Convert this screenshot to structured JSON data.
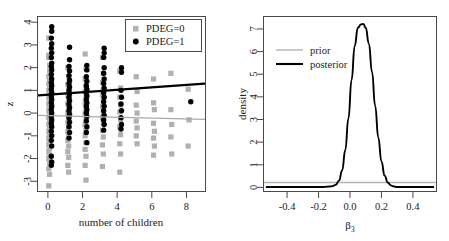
{
  "figure": {
    "title": "",
    "panels": [
      "scatter",
      "density"
    ]
  },
  "left_panel": {
    "xlabel": "number of children",
    "ylabel": "z",
    "xticks": [
      "0",
      "2",
      "4",
      "6",
      "8"
    ],
    "yticks": [
      "-3",
      "-2",
      "-1",
      "0",
      "1",
      "2",
      "3",
      "4"
    ],
    "legend": {
      "items": [
        {
          "label": "PDEG=0",
          "marker": "square",
          "color": "#b0b0b0"
        },
        {
          "label": "PDEG=1",
          "marker": "circle",
          "color": "#000000"
        }
      ]
    }
  },
  "right_panel": {
    "xlabel": "β₃",
    "xlabel_base": "β",
    "xlabel_sub": "3",
    "ylabel": "density",
    "xticks": [
      "-0.4",
      "-0.2",
      "0.0",
      "0.2",
      "0.4"
    ],
    "yticks": [
      "0",
      "1",
      "2",
      "3",
      "4",
      "5",
      "6",
      "7"
    ],
    "legend": {
      "items": [
        {
          "label": "prior",
          "color": "#b4b4b4"
        },
        {
          "label": "posterior",
          "color": "#000000"
        }
      ]
    }
  },
  "chart_data": [
    {
      "type": "scatter",
      "title": "",
      "xlabel": "number of children",
      "ylabel": "z",
      "xlim": [
        -0.6,
        9.1
      ],
      "ylim": [
        -3.45,
        4.25
      ],
      "xticks": [
        0,
        2,
        4,
        6,
        8
      ],
      "yticks": [
        -3,
        -2,
        -1,
        0,
        1,
        2,
        3,
        4
      ],
      "grid": false,
      "legend_position": "top-right",
      "series": [
        {
          "name": "PDEG=0",
          "marker": "square",
          "color": "#b0b0b0",
          "points": [
            [
              0.05,
              3.3
            ],
            [
              0.05,
              2.55
            ],
            [
              0.05,
              2.45
            ],
            [
              0.1,
              2.1
            ],
            [
              0.1,
              1.85
            ],
            [
              0.05,
              1.6
            ],
            [
              0.1,
              1.45
            ],
            [
              0.05,
              1.3
            ],
            [
              0.1,
              1.15
            ],
            [
              0.05,
              1.0
            ],
            [
              0.1,
              0.85
            ],
            [
              0.05,
              0.7
            ],
            [
              0.1,
              0.55
            ],
            [
              0.05,
              0.4
            ],
            [
              0.1,
              0.25
            ],
            [
              0.05,
              0.1
            ],
            [
              0.1,
              -0.05
            ],
            [
              0.05,
              -0.2
            ],
            [
              0.1,
              -0.35
            ],
            [
              0.05,
              -0.5
            ],
            [
              0.1,
              -0.65
            ],
            [
              0.05,
              -0.8
            ],
            [
              0.1,
              -0.95
            ],
            [
              0.05,
              -1.1
            ],
            [
              0.1,
              -1.25
            ],
            [
              0.05,
              -1.4
            ],
            [
              0.1,
              -1.55
            ],
            [
              0.05,
              -1.7
            ],
            [
              0.1,
              -1.85
            ],
            [
              0.05,
              -2.0
            ],
            [
              0.1,
              -2.2
            ],
            [
              0.05,
              -2.45
            ],
            [
              0.1,
              -2.7
            ],
            [
              0.05,
              -3.2
            ],
            [
              1.15,
              2.0
            ],
            [
              1.2,
              1.6
            ],
            [
              1.15,
              1.25
            ],
            [
              1.2,
              1.0
            ],
            [
              1.15,
              0.8
            ],
            [
              1.2,
              0.6
            ],
            [
              1.15,
              0.4
            ],
            [
              1.2,
              0.2
            ],
            [
              1.15,
              0.0
            ],
            [
              1.2,
              -0.2
            ],
            [
              1.15,
              -0.4
            ],
            [
              1.2,
              -0.6
            ],
            [
              1.15,
              -0.8
            ],
            [
              1.2,
              -1.0
            ],
            [
              1.15,
              -1.2
            ],
            [
              1.2,
              -1.45
            ],
            [
              1.15,
              -1.7
            ],
            [
              1.2,
              -1.95
            ],
            [
              1.15,
              -2.3
            ],
            [
              1.2,
              -2.6
            ],
            [
              2.15,
              2.6
            ],
            [
              2.2,
              1.95
            ],
            [
              2.15,
              1.5
            ],
            [
              2.2,
              1.2
            ],
            [
              2.15,
              0.95
            ],
            [
              2.2,
              0.7
            ],
            [
              2.15,
              0.45
            ],
            [
              2.2,
              0.2
            ],
            [
              2.15,
              0.0
            ],
            [
              2.2,
              -0.25
            ],
            [
              2.15,
              -0.5
            ],
            [
              2.2,
              -0.75
            ],
            [
              2.15,
              -1.0
            ],
            [
              2.2,
              -1.3
            ],
            [
              2.15,
              -1.6
            ],
            [
              2.2,
              -1.9
            ],
            [
              2.15,
              -2.3
            ],
            [
              2.2,
              -2.95
            ],
            [
              3.15,
              2.45
            ],
            [
              3.2,
              1.75
            ],
            [
              3.15,
              1.35
            ],
            [
              3.2,
              1.05
            ],
            [
              3.15,
              0.8
            ],
            [
              3.2,
              0.55
            ],
            [
              3.15,
              0.3
            ],
            [
              3.2,
              0.05
            ],
            [
              3.15,
              -0.2
            ],
            [
              3.2,
              -0.45
            ],
            [
              3.15,
              -0.75
            ],
            [
              3.2,
              -1.05
            ],
            [
              3.15,
              -1.4
            ],
            [
              3.2,
              -1.8
            ],
            [
              3.15,
              -2.35
            ],
            [
              4.15,
              1.85
            ],
            [
              4.2,
              1.1
            ],
            [
              4.15,
              0.7
            ],
            [
              4.2,
              0.35
            ],
            [
              4.15,
              0.05
            ],
            [
              4.2,
              -0.3
            ],
            [
              4.15,
              -0.6
            ],
            [
              4.2,
              -0.95
            ],
            [
              4.15,
              -1.35
            ],
            [
              4.2,
              -1.8
            ],
            [
              4.15,
              -2.6
            ],
            [
              5.1,
              1.6
            ],
            [
              5.15,
              0.95
            ],
            [
              5.1,
              0.35
            ],
            [
              5.15,
              0.0
            ],
            [
              5.1,
              -0.35
            ],
            [
              5.15,
              -0.65
            ],
            [
              5.1,
              -1.0
            ],
            [
              5.15,
              -1.35
            ],
            [
              6.1,
              1.5
            ],
            [
              6.1,
              0.45
            ],
            [
              6.15,
              0.15
            ],
            [
              6.1,
              -0.45
            ],
            [
              6.15,
              -0.8
            ],
            [
              6.1,
              -1.1
            ],
            [
              6.15,
              -1.45
            ],
            [
              6.1,
              -1.85
            ],
            [
              7.1,
              1.75
            ],
            [
              7.1,
              0.15
            ],
            [
              7.15,
              -0.5
            ],
            [
              7.1,
              -1.05
            ],
            [
              7.15,
              -1.8
            ],
            [
              8.1,
              1.05
            ],
            [
              8.15,
              -0.3
            ],
            [
              8.1,
              -1.45
            ]
          ]
        },
        {
          "name": "PDEG=1",
          "marker": "circle",
          "color": "#000000",
          "points": [
            [
              0.22,
              3.8
            ],
            [
              0.22,
              3.6
            ],
            [
              0.2,
              3.3
            ],
            [
              0.22,
              3.05
            ],
            [
              0.2,
              2.85
            ],
            [
              0.22,
              2.65
            ],
            [
              0.2,
              2.45
            ],
            [
              0.22,
              2.2
            ],
            [
              0.2,
              2.05
            ],
            [
              0.22,
              1.9
            ],
            [
              0.2,
              1.7
            ],
            [
              0.22,
              1.5
            ],
            [
              0.2,
              1.35
            ],
            [
              0.22,
              1.2
            ],
            [
              0.2,
              1.05
            ],
            [
              0.22,
              0.9
            ],
            [
              0.2,
              0.75
            ],
            [
              0.22,
              0.6
            ],
            [
              0.2,
              0.45
            ],
            [
              0.22,
              0.3
            ],
            [
              0.2,
              0.15
            ],
            [
              0.22,
              0.0
            ],
            [
              0.2,
              -0.15
            ],
            [
              0.22,
              -0.3
            ],
            [
              0.2,
              -0.45
            ],
            [
              0.22,
              -0.6
            ],
            [
              0.2,
              -0.8
            ],
            [
              0.22,
              -1.0
            ],
            [
              0.2,
              -1.2
            ],
            [
              0.22,
              -1.45
            ],
            [
              0.2,
              -1.9
            ],
            [
              0.22,
              -2.15
            ],
            [
              0.2,
              -2.3
            ],
            [
              1.25,
              2.9
            ],
            [
              1.25,
              2.35
            ],
            [
              1.22,
              2.05
            ],
            [
              1.25,
              1.85
            ],
            [
              1.22,
              1.65
            ],
            [
              1.25,
              1.45
            ],
            [
              1.22,
              1.3
            ],
            [
              1.25,
              1.15
            ],
            [
              1.22,
              1.0
            ],
            [
              1.25,
              0.85
            ],
            [
              1.22,
              0.7
            ],
            [
              1.25,
              0.55
            ],
            [
              1.22,
              0.4
            ],
            [
              1.25,
              0.25
            ],
            [
              1.22,
              0.1
            ],
            [
              1.25,
              -0.05
            ],
            [
              1.22,
              -0.2
            ],
            [
              1.25,
              -0.4
            ],
            [
              1.22,
              -0.6
            ],
            [
              1.25,
              -0.85
            ],
            [
              1.22,
              -1.1
            ],
            [
              2.25,
              2.1
            ],
            [
              2.25,
              1.9
            ],
            [
              2.22,
              1.6
            ],
            [
              2.25,
              1.4
            ],
            [
              2.22,
              1.2
            ],
            [
              2.25,
              1.05
            ],
            [
              2.22,
              0.9
            ],
            [
              2.25,
              0.75
            ],
            [
              2.22,
              0.6
            ],
            [
              2.25,
              0.45
            ],
            [
              2.22,
              0.3
            ],
            [
              2.25,
              0.15
            ],
            [
              2.22,
              0.0
            ],
            [
              2.25,
              -0.15
            ],
            [
              2.22,
              -0.35
            ],
            [
              2.25,
              -0.6
            ],
            [
              2.22,
              -0.85
            ],
            [
              2.25,
              -1.3
            ],
            [
              3.25,
              2.85
            ],
            [
              3.25,
              2.65
            ],
            [
              3.22,
              2.45
            ],
            [
              3.25,
              2.0
            ],
            [
              3.22,
              1.75
            ],
            [
              3.25,
              1.5
            ],
            [
              3.22,
              1.3
            ],
            [
              3.25,
              1.1
            ],
            [
              3.22,
              0.9
            ],
            [
              3.25,
              0.7
            ],
            [
              3.22,
              0.5
            ],
            [
              3.25,
              0.3
            ],
            [
              3.22,
              0.1
            ],
            [
              3.25,
              -0.1
            ],
            [
              3.22,
              -0.3
            ],
            [
              3.25,
              -0.5
            ],
            [
              3.22,
              -0.75
            ],
            [
              4.25,
              2.0
            ],
            [
              4.25,
              1.8
            ],
            [
              4.22,
              1.0
            ],
            [
              4.25,
              0.7
            ],
            [
              4.22,
              0.4
            ],
            [
              4.25,
              0.1
            ],
            [
              4.22,
              -0.2
            ],
            [
              4.25,
              -0.5
            ],
            [
              4.22,
              -0.7
            ],
            [
              8.25,
              0.5
            ]
          ]
        }
      ],
      "fit_lines": [
        {
          "name": "PDEG=1 fit",
          "color": "#000000",
          "x": [
            -0.55,
            9.05
          ],
          "y": [
            0.78,
            1.3
          ]
        },
        {
          "name": "PDEG=0 fit",
          "color": "#a9a9a9",
          "x": [
            -0.55,
            9.05
          ],
          "y": [
            -0.1,
            -0.28
          ]
        }
      ]
    },
    {
      "type": "line",
      "title": "",
      "xlabel": "β₃",
      "ylabel": "density",
      "xlim": [
        -0.55,
        0.55
      ],
      "ylim": [
        -0.18,
        7.55
      ],
      "xticks": [
        -0.4,
        -0.2,
        0.0,
        0.2,
        0.4
      ],
      "yticks": [
        0,
        1,
        2,
        3,
        4,
        5,
        6,
        7
      ],
      "grid": false,
      "legend_position": "upper-left",
      "series": [
        {
          "name": "prior",
          "color": "#b4b4b4",
          "description": "flat near-uniform density at about 0.22",
          "x": [
            -0.55,
            0.55
          ],
          "y": [
            0.22,
            0.22
          ]
        },
        {
          "name": "posterior",
          "color": "#000000",
          "description": "unimodal normal-like density, mode near 0.085, peak height about 7.2",
          "mode": 0.085,
          "peak": 7.2,
          "sd": 0.055,
          "x": [
            -0.19,
            -0.17,
            -0.15,
            -0.13,
            -0.11,
            -0.09,
            -0.07,
            -0.05,
            -0.03,
            -0.01,
            0.01,
            0.03,
            0.05,
            0.07,
            0.085,
            0.1,
            0.12,
            0.14,
            0.16,
            0.18,
            0.2,
            0.22,
            0.24,
            0.26,
            0.28,
            0.3,
            0.31
          ],
          "y": [
            0.02,
            0.02,
            0.03,
            0.04,
            0.06,
            0.12,
            0.3,
            0.75,
            1.65,
            3.05,
            4.75,
            6.25,
            7.05,
            7.2,
            7.22,
            7.05,
            6.35,
            5.1,
            3.6,
            2.2,
            1.15,
            0.52,
            0.22,
            0.09,
            0.04,
            0.02,
            0.02
          ]
        }
      ]
    }
  ]
}
